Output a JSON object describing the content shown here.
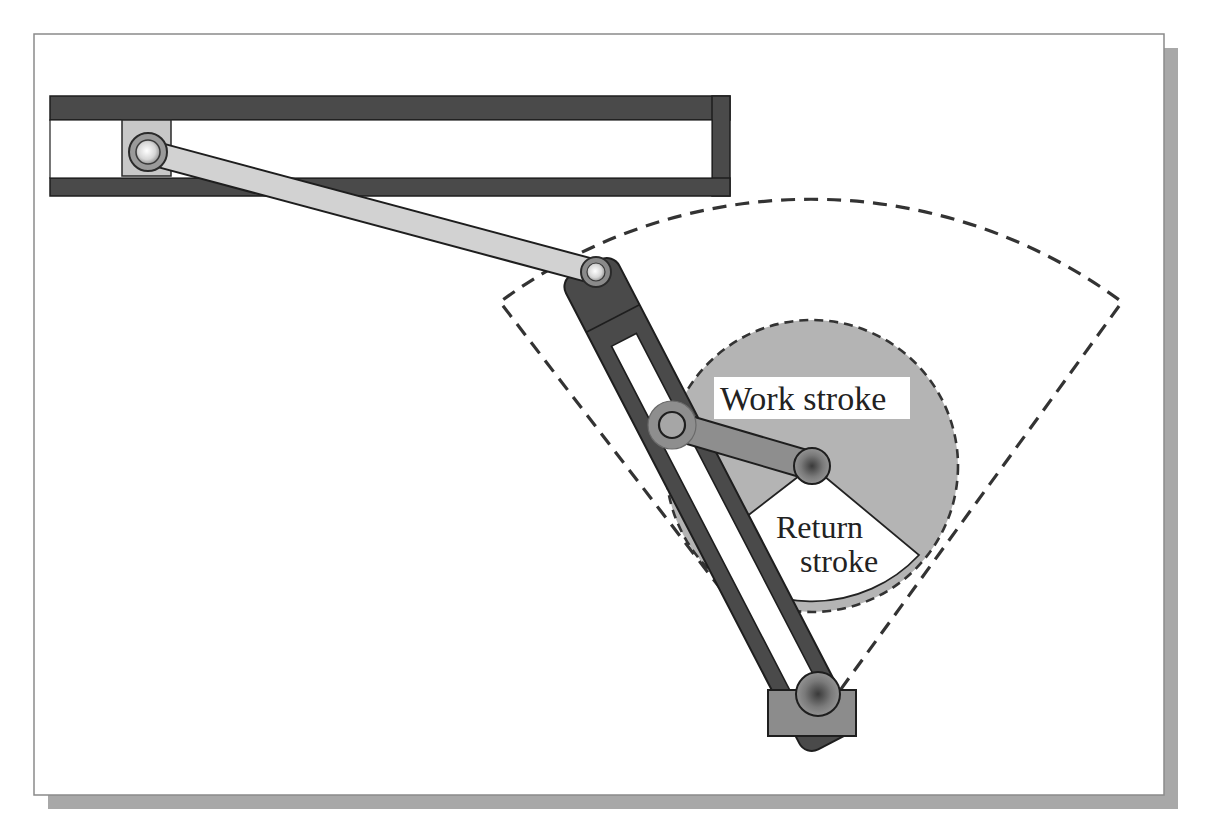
{
  "figure": {
    "type": "mechanism-diagram"
  },
  "labels": {
    "work_stroke": "Work stroke",
    "return_stroke_line1": "Return",
    "return_stroke_line2": "stroke"
  },
  "components": [
    "horizontal slide guide",
    "slider block with pin",
    "connecting link",
    "slotted lever",
    "crank",
    "crank pivot",
    "lever ground pivot",
    "work stroke sector",
    "return stroke sector",
    "crank circle (dashed)",
    "lever swing sector (dashed)"
  ],
  "colors": {
    "frame_border": "#8a8a8a",
    "frame_shadow": "#a8a8a8",
    "dark_part": "#4a4a4a",
    "outline": "#1e1e1e",
    "link_light": "#cfcfcf",
    "crank_gray": "#8e8e8e",
    "sector_gray": "#b4b4b4",
    "ground_block": "#8c8c8c",
    "label_bg": "#ffffff",
    "dash": "#333333"
  }
}
